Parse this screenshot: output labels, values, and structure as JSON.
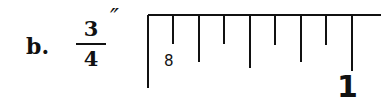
{
  "problem": {
    "label": "b.",
    "fraction": {
      "numerator": "3",
      "denominator": "4"
    },
    "unit_symbol": "″"
  },
  "ruler": {
    "left_x": 148,
    "top_y": 15,
    "right_x": 381,
    "left_edge_bottom_y": 88,
    "ticks": [
      {
        "x": 173,
        "bottom": 44
      },
      {
        "x": 199,
        "bottom": 62
      },
      {
        "x": 224,
        "bottom": 44
      },
      {
        "x": 250,
        "bottom": 68
      },
      {
        "x": 275,
        "bottom": 45
      },
      {
        "x": 301,
        "bottom": 62
      },
      {
        "x": 326,
        "bottom": 45
      },
      {
        "x": 352,
        "bottom": 71
      }
    ],
    "labels": [
      {
        "text": "8",
        "x": 164,
        "y": 66,
        "size": 15,
        "weight": "normal"
      },
      {
        "text": "1",
        "x": 337,
        "y": 97,
        "size": 30,
        "weight": "bold"
      }
    ],
    "stroke_color": "#111111"
  }
}
